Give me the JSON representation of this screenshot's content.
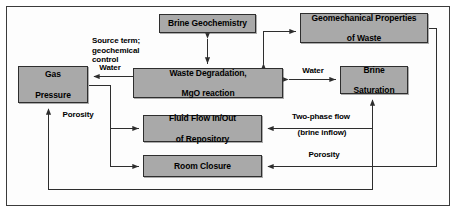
{
  "figure": {
    "type": "flow-diagram",
    "background_color": "#ffffff",
    "frame_color": "#3b3b3b",
    "node_fill_color": "#a9a9a9",
    "node_border_color": "#2e2e2e",
    "wire_color": "#2e2e2e"
  },
  "nodes": [
    {
      "id": "brine-geochemistry",
      "label": "Brine Geochemistry",
      "lines": [
        "Brine Geochemistry"
      ],
      "x": 159,
      "y": 14,
      "w": 97,
      "h": 19
    },
    {
      "id": "geomechanical-properties-of-waste",
      "label": "Geomechanical Properties of Waste",
      "lines": [
        "Geomechanical Properties",
        "of Waste"
      ],
      "x": 300,
      "y": 13,
      "w": 128,
      "h": 30
    },
    {
      "id": "gas-pressure",
      "label": "Gas Pressure",
      "lines": [
        "Gas",
        "Pressure"
      ],
      "x": 18,
      "y": 66,
      "w": 70,
      "h": 37
    },
    {
      "id": "waste-degradation-mgo-reaction",
      "label": "Waste Degradation, MgO reaction",
      "lines": [
        "Waste Degradation,",
        "MgO reaction"
      ],
      "x": 133,
      "y": 68,
      "w": 150,
      "h": 30
    },
    {
      "id": "brine-saturation",
      "label": "Brine Saturation",
      "lines": [
        "Brine",
        "Saturation"
      ],
      "x": 340,
      "y": 66,
      "w": 68,
      "h": 28
    },
    {
      "id": "fluid-flow-in-out-of-repository",
      "label": "Fluid Flow In/Out of Repository",
      "lines": [
        "Fluid Flow In/Out",
        "of Repository"
      ],
      "x": 143,
      "y": 115,
      "w": 119,
      "h": 27
    },
    {
      "id": "room-closure",
      "label": "Room Closure",
      "lines": [
        "Room Closure"
      ],
      "x": 143,
      "y": 155,
      "w": 119,
      "h": 22
    }
  ],
  "edge_labels": [
    {
      "id": "source-term-geochemical-control",
      "lines": [
        "Source term;",
        "geochemical",
        "control"
      ],
      "x": 92,
      "y": 36,
      "w": 66,
      "align": "left"
    },
    {
      "id": "water-left",
      "lines": [
        "Water"
      ],
      "x": 93,
      "y": 63,
      "w": 34,
      "align": "center"
    },
    {
      "id": "water-right",
      "lines": [
        "Water"
      ],
      "x": 296,
      "y": 66,
      "w": 34,
      "align": "center"
    },
    {
      "id": "porosity-left",
      "lines": [
        "Porosity"
      ],
      "x": 56,
      "y": 110,
      "w": 44,
      "align": "center"
    },
    {
      "id": "two-phase-flow",
      "lines": [
        "Two-phase flow"
      ],
      "x": 283,
      "y": 112,
      "w": 76,
      "align": "center"
    },
    {
      "id": "brine-inflow",
      "lines": [
        "(brine inflow)"
      ],
      "x": 287,
      "y": 128,
      "w": 70,
      "align": "center"
    },
    {
      "id": "porosity-right",
      "lines": [
        "Porosity"
      ],
      "x": 302,
      "y": 150,
      "w": 44,
      "align": "center"
    }
  ],
  "connections": [
    {
      "from": "brine-geochemistry",
      "to": "waste-degradation-mgo-reaction",
      "label": "Source term; geochemical control",
      "direction": "bidirectional"
    },
    {
      "from": "waste-degradation-mgo-reaction",
      "to": "geomechanical-properties-of-waste",
      "label": "",
      "direction": "forward"
    },
    {
      "from": "waste-degradation-mgo-reaction",
      "to": "gas-pressure",
      "label": "Water",
      "direction": "forward"
    },
    {
      "from": "waste-degradation-mgo-reaction",
      "to": "brine-saturation",
      "label": "Water",
      "direction": "bidirectional"
    },
    {
      "from": "gas-pressure",
      "to": "fluid-flow-in-out-of-repository",
      "label": "Porosity",
      "direction": "forward"
    },
    {
      "from": "gas-pressure",
      "to": "room-closure",
      "label": "Porosity",
      "direction": "forward"
    },
    {
      "from": "brine-saturation",
      "to": "fluid-flow-in-out-of-repository",
      "label": "Two-phase flow (brine inflow)",
      "direction": "forward"
    },
    {
      "from": "geomechanical-properties-of-waste",
      "to": "room-closure",
      "label": "Porosity",
      "direction": "forward"
    },
    {
      "from": "fluid-flow-in-out-of-repository",
      "to": "brine-saturation",
      "label": "",
      "direction": "forward"
    },
    {
      "from": "room-closure",
      "to": "gas-pressure",
      "label": "",
      "direction": "forward"
    }
  ]
}
